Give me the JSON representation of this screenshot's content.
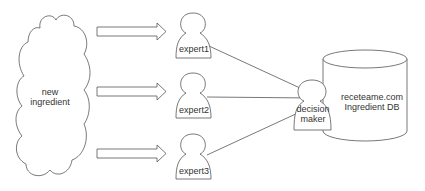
{
  "diagram": {
    "source": {
      "label_line1": "new",
      "label_line2": "ingredient",
      "shape": "cloud-icon"
    },
    "experts": [
      {
        "label": "expert1",
        "shape": "person-icon"
      },
      {
        "label": "expert2",
        "shape": "person-icon"
      },
      {
        "label": "expert3",
        "shape": "person-icon"
      }
    ],
    "decision_maker": {
      "label_line1": "decision",
      "label_line2": "maker",
      "shape": "person-icon"
    },
    "database": {
      "label_line1": "receteame.com",
      "label_line2": "Ingredient DB",
      "shape": "cylinder-icon"
    },
    "edges": [
      {
        "from": "new ingredient",
        "to": "expert1",
        "style": "block-arrow"
      },
      {
        "from": "new ingredient",
        "to": "expert2",
        "style": "block-arrow"
      },
      {
        "from": "new ingredient",
        "to": "expert3",
        "style": "block-arrow"
      },
      {
        "from": "expert1",
        "to": "decision maker",
        "style": "line-arrow"
      },
      {
        "from": "expert2",
        "to": "decision maker",
        "style": "line-arrow"
      },
      {
        "from": "expert3",
        "to": "decision maker",
        "style": "line-arrow"
      }
    ],
    "colors": {
      "stroke": "#555555",
      "text": "#333333",
      "background": "#ffffff"
    }
  }
}
